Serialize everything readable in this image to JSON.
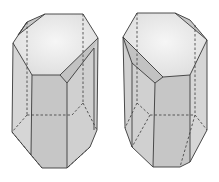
{
  "figure": {
    "colors": {
      "top_face": "#ececec",
      "side_face": "#d2d2d2",
      "front_face": "#c6c6c6",
      "facet": "#c0c0c0",
      "edge": "#3a3a3a",
      "background": "#ffffff"
    },
    "crystals": [
      {
        "id": "left-crystal",
        "orientation": "right-handed"
      },
      {
        "id": "right-crystal",
        "orientation": "left-handed"
      }
    ]
  }
}
